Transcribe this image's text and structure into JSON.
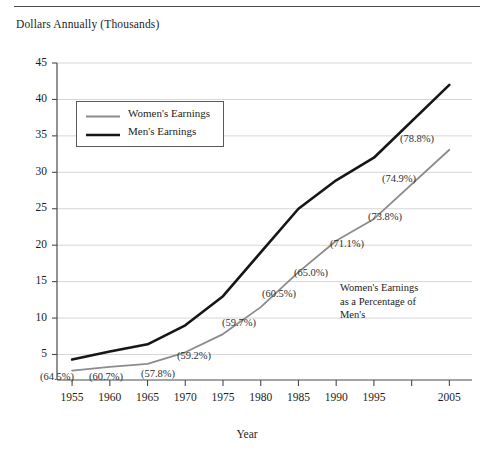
{
  "chart_data": {
    "type": "line",
    "title": "",
    "subtitle": "",
    "ylabel": "Dollars Annually (Thousands)",
    "xlabel": "Year",
    "x": [
      1955,
      1960,
      1965,
      1970,
      1975,
      1980,
      1985,
      1990,
      1995,
      2005
    ],
    "categories": [
      "1955",
      "1960",
      "1965",
      "1970",
      "1975",
      "1980",
      "1985",
      "1990",
      "1995",
      "2005"
    ],
    "xtick_labels": [
      "1955",
      "1960",
      "1965",
      "1970",
      "1975",
      "1980",
      "1985",
      "1990",
      "1995",
      "",
      "2005"
    ],
    "xticks": [
      1955,
      1960,
      1965,
      1970,
      1975,
      1980,
      1985,
      1990,
      1995,
      2000,
      2005
    ],
    "ytick_labels": [
      "5",
      "10",
      "15",
      "20",
      "25",
      "30",
      "35",
      "40",
      "45"
    ],
    "yticks": [
      5,
      10,
      15,
      20,
      25,
      30,
      35,
      40,
      45
    ],
    "xlim": [
      1953,
      2008
    ],
    "ylim": [
      1.5,
      45
    ],
    "grid": "horizontal",
    "legend_position": "upper-left-inside",
    "series": [
      {
        "name": "Women's Earnings",
        "color": "#8c8c8c",
        "width": 1.8,
        "values": [
          2.8,
          3.3,
          3.7,
          5.3,
          7.8,
          11.5,
          16.3,
          20.6,
          23.6,
          33.1
        ]
      },
      {
        "name": "Men's Earnings",
        "color": "#161616",
        "width": 2.6,
        "values": [
          4.3,
          5.4,
          6.4,
          9.0,
          13.0,
          19.0,
          25.0,
          28.9,
          32.0,
          42.0
        ]
      }
    ],
    "annotations": [
      {
        "id": "pct-1955",
        "text": "(64.5%)",
        "x_px": 40,
        "y_px": 371
      },
      {
        "id": "pct-1960",
        "text": "(60.7%)",
        "x_px": 89,
        "y_px": 371
      },
      {
        "id": "pct-1965",
        "text": "(57.8%)",
        "x_px": 141,
        "y_px": 368
      },
      {
        "id": "pct-1970",
        "text": "(59.2%)",
        "x_px": 177,
        "y_px": 350
      },
      {
        "id": "pct-1975",
        "text": "(59.7%)",
        "x_px": 222,
        "y_px": 317
      },
      {
        "id": "pct-1980",
        "text": "(60.5%)",
        "x_px": 262,
        "y_px": 288
      },
      {
        "id": "pct-1985",
        "text": "(65.0%)",
        "x_px": 294,
        "y_px": 267
      },
      {
        "id": "pct-1990",
        "text": "(71.1%)",
        "x_px": 330,
        "y_px": 238
      },
      {
        "id": "pct-1995",
        "text": "(73.8%)",
        "x_px": 368,
        "y_px": 211
      },
      {
        "id": "pct-2000",
        "text": "(74.9%)",
        "x_px": 382,
        "y_px": 173
      },
      {
        "id": "pct-2005",
        "text": "(78.8%)",
        "x_px": 400,
        "y_px": 133
      }
    ],
    "note_block": {
      "lines": [
        "Women's Earnings",
        "as a Percentage of",
        "Men's"
      ]
    }
  },
  "legend": {
    "items": [
      {
        "label": "Women's Earnings",
        "color": "#8c8c8c",
        "width": 1.8
      },
      {
        "label": "Men's Earnings",
        "color": "#161616",
        "width": 2.6
      }
    ]
  }
}
